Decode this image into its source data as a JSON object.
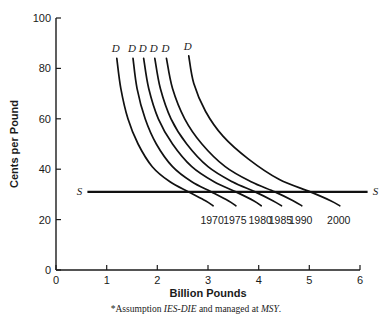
{
  "chart_data": {
    "type": "line",
    "title": "",
    "xlabel": "Billion Pounds",
    "ylabel": "Cents per Pound",
    "xlim": [
      0,
      6
    ],
    "ylim": [
      0,
      100
    ],
    "xticks": [
      "0",
      "1",
      "2",
      "3",
      "4",
      "5",
      "6"
    ],
    "yticks": [
      "0",
      "20",
      "40",
      "60",
      "80",
      "100"
    ],
    "grid": false,
    "legend": "none",
    "supply": {
      "label_left": "S",
      "label_right": "S",
      "price": 31,
      "x_start": 0.62,
      "x_end": 6.15,
      "description": "Horizontal supply curve at about 31 cents per pound"
    },
    "demand_label": "D",
    "series": [
      {
        "name": "1970",
        "curve_label": "D",
        "top_x": 1.2,
        "top_y": 84,
        "equilibrium_x": 2.62,
        "equilibrium_y": 31,
        "points": [
          [
            1.2,
            84
          ],
          [
            1.28,
            72
          ],
          [
            1.42,
            60
          ],
          [
            1.62,
            50
          ],
          [
            1.9,
            41
          ],
          [
            2.25,
            35
          ],
          [
            2.62,
            31
          ],
          [
            2.95,
            27.5
          ],
          [
            3.1,
            25.5
          ]
        ]
      },
      {
        "name": "1975",
        "curve_label": "D",
        "top_x": 1.52,
        "top_y": 84,
        "equilibrium_x": 3.07,
        "equilibrium_y": 31,
        "points": [
          [
            1.52,
            84
          ],
          [
            1.6,
            72
          ],
          [
            1.76,
            60
          ],
          [
            1.98,
            50
          ],
          [
            2.3,
            41
          ],
          [
            2.68,
            35
          ],
          [
            3.07,
            31
          ],
          [
            3.4,
            27.5
          ],
          [
            3.55,
            25.5
          ]
        ]
      },
      {
        "name": "1980",
        "curve_label": "D",
        "top_x": 1.73,
        "top_y": 84,
        "equilibrium_x": 3.55,
        "equilibrium_y": 31,
        "points": [
          [
            1.73,
            84
          ],
          [
            1.83,
            72
          ],
          [
            2.02,
            60
          ],
          [
            2.3,
            50
          ],
          [
            2.68,
            41
          ],
          [
            3.12,
            35
          ],
          [
            3.55,
            31
          ],
          [
            3.9,
            27.5
          ],
          [
            4.05,
            25.5
          ]
        ]
      },
      {
        "name": "1985",
        "curve_label": "D",
        "top_x": 1.95,
        "top_y": 84,
        "equilibrium_x": 3.93,
        "equilibrium_y": 31,
        "points": [
          [
            1.95,
            84
          ],
          [
            2.06,
            72
          ],
          [
            2.27,
            60
          ],
          [
            2.58,
            50
          ],
          [
            3.0,
            41
          ],
          [
            3.48,
            35
          ],
          [
            3.93,
            31
          ],
          [
            4.28,
            27.5
          ],
          [
            4.45,
            25.5
          ]
        ]
      },
      {
        "name": "1990",
        "curve_label": "D",
        "top_x": 2.18,
        "top_y": 84,
        "equilibrium_x": 4.32,
        "equilibrium_y": 31,
        "points": [
          [
            2.18,
            84
          ],
          [
            2.3,
            72
          ],
          [
            2.54,
            60
          ],
          [
            2.88,
            50
          ],
          [
            3.34,
            41
          ],
          [
            3.85,
            35
          ],
          [
            4.32,
            31
          ],
          [
            4.68,
            27.5
          ],
          [
            4.85,
            25.5
          ]
        ]
      },
      {
        "name": "2000",
        "curve_label": "D",
        "top_x": 2.62,
        "top_y": 85,
        "equilibrium_x": 5.02,
        "equilibrium_y": 31,
        "points": [
          [
            2.62,
            85
          ],
          [
            2.72,
            74
          ],
          [
            2.95,
            63
          ],
          [
            3.3,
            53
          ],
          [
            3.8,
            44
          ],
          [
            4.4,
            36
          ],
          [
            5.02,
            31
          ],
          [
            5.42,
            27.5
          ],
          [
            5.6,
            25.5
          ]
        ]
      }
    ]
  },
  "footnote": {
    "prefix": "*Assumption ",
    "em1": "IES-DIE",
    "middle": " and managed at ",
    "em2": "MSY",
    "suffix": "."
  }
}
